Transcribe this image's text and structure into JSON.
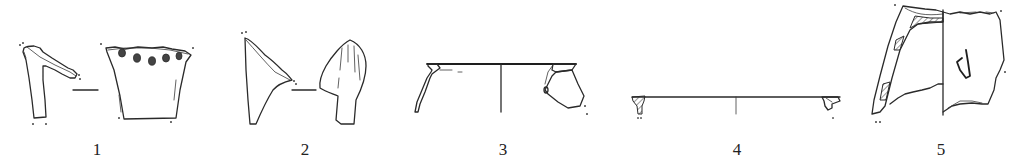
{
  "figure": {
    "items": [
      {
        "number": "1",
        "name": "sherd-1",
        "views": [
          "profile",
          "exterior"
        ],
        "feature": "row of perforations below rim"
      },
      {
        "number": "2",
        "name": "sherd-2",
        "views": [
          "profile",
          "exterior"
        ],
        "feature": "pointed foot / leg fragment"
      },
      {
        "number": "3",
        "name": "sherd-3",
        "views": [
          "rim-profile-left",
          "rim-profile-right"
        ],
        "feature": "carinated bowl rim"
      },
      {
        "number": "4",
        "name": "sherd-4",
        "views": [
          "rim-profile-left",
          "rim-profile-right"
        ],
        "feature": "flat everted rim, wide diameter"
      },
      {
        "number": "5",
        "name": "sherd-5",
        "views": [
          "section",
          "exterior"
        ],
        "feature": "vessel wall with applied lug"
      }
    ]
  }
}
